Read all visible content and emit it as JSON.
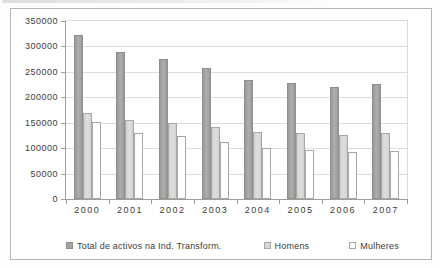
{
  "chart_data": {
    "type": "bar",
    "title": "",
    "xlabel": "",
    "ylabel": "",
    "categories": [
      "2000",
      "2001",
      "2002",
      "2003",
      "2004",
      "2005",
      "2006",
      "2007"
    ],
    "series": [
      {
        "name": "Total de activos na Ind. Transform.",
        "color": "#a3a3a1",
        "values": [
          322000,
          290000,
          275000,
          258000,
          234000,
          228000,
          221000,
          226000
        ]
      },
      {
        "name": "Homens",
        "color": "#d6d6d4",
        "values": [
          170000,
          156000,
          149000,
          142000,
          132000,
          129000,
          126000,
          129000
        ]
      },
      {
        "name": "Mulheres",
        "color": "#ffffff",
        "values": [
          151000,
          130000,
          123000,
          112000,
          100000,
          97000,
          92000,
          95000
        ]
      }
    ],
    "ylim": [
      0,
      350000
    ],
    "ytick_step": 50000,
    "yticks": [
      "0",
      "50000",
      "100000",
      "150000",
      "200000",
      "250000",
      "300000",
      "350000"
    ],
    "grid": true,
    "legend_position": "bottom",
    "colors": {
      "gridline": "#dddddb",
      "axis": "#9d9d9a",
      "text": "#3c3c3a",
      "frame_border": "#b3b3b0",
      "background": "#ffffff"
    }
  }
}
